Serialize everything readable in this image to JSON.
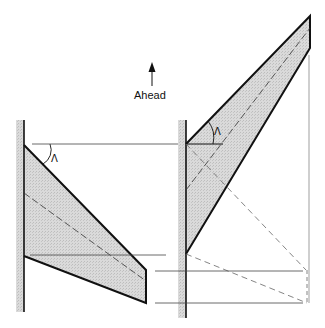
{
  "diagram": {
    "direction_label": "Ahead",
    "sweep_angle_symbol": "Λ",
    "colors": {
      "wing_fill": "#d4d4d4",
      "fuselage_fill": "#c8c8c8",
      "outline": "#111111",
      "construction_line": "#555555"
    },
    "wings": [
      {
        "name": "aft-swept wing",
        "sweep_label": "Λ"
      },
      {
        "name": "forward-swept wing",
        "sweep_label": "Λ"
      }
    ]
  }
}
